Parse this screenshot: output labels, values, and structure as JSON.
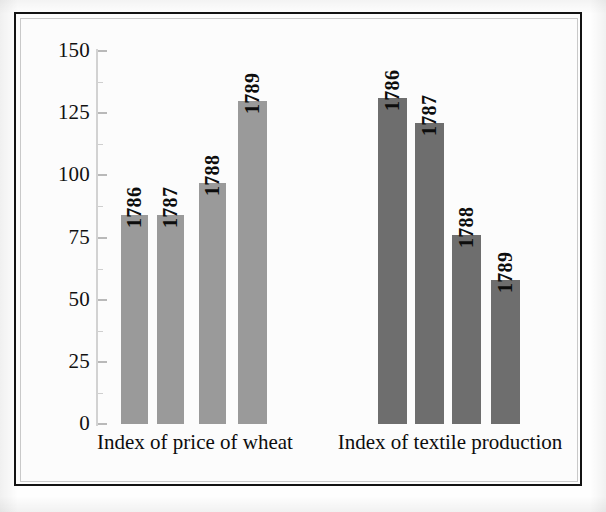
{
  "figure": {
    "background": "#fdfdfd",
    "frame_color": "#131313",
    "inner_frame_color": "#c9c9c9"
  },
  "chart_data": {
    "type": "bar",
    "title": "",
    "subtitle": "",
    "xlabel": "",
    "ylabel": "",
    "ylim": [
      0,
      150
    ],
    "yticks": [
      0,
      25,
      50,
      75,
      100,
      125,
      150
    ],
    "ytick_labels": [
      "0",
      "25",
      "50",
      "75",
      "100",
      "125",
      "150"
    ],
    "minor_ticks": [
      12.5,
      37.5,
      62.5,
      87.5,
      112.5,
      137.5
    ],
    "grid": false,
    "legend": "none",
    "categories": [
      "1786",
      "1787",
      "1788",
      "1789"
    ],
    "series": [
      {
        "name": "Index of price of wheat",
        "color": "#9a9a9a",
        "values": [
          84,
          84,
          97,
          130
        ]
      },
      {
        "name": "Index of textile production",
        "color": "#6e6e6e",
        "values": [
          131,
          121,
          76,
          58
        ]
      }
    ],
    "bar_labels": [
      [
        "1786",
        "1787",
        "1788",
        "1789"
      ],
      [
        "1786",
        "1787",
        "1788",
        "1789"
      ]
    ],
    "group_labels": [
      "Index of price of wheat",
      "Index of textile production"
    ]
  },
  "geometry": {
    "axis_x": 96,
    "y_zero_px": 424,
    "y_max_px": 51,
    "bars": [
      {
        "x": 121,
        "w": 27,
        "group": 0,
        "index": 0
      },
      {
        "x": 157,
        "w": 27,
        "group": 0,
        "index": 1
      },
      {
        "x": 199,
        "w": 27,
        "group": 0,
        "index": 2
      },
      {
        "x": 238,
        "w": 29,
        "group": 0,
        "index": 3
      },
      {
        "x": 378,
        "w": 29,
        "group": 1,
        "index": 0
      },
      {
        "x": 415,
        "w": 29,
        "group": 1,
        "index": 1
      },
      {
        "x": 452,
        "w": 29,
        "group": 1,
        "index": 2
      },
      {
        "x": 491,
        "w": 29,
        "group": 1,
        "index": 3
      }
    ],
    "group_label_pos": [
      {
        "cx": 195,
        "y": 432
      },
      {
        "cx": 450,
        "y": 432
      }
    ]
  }
}
